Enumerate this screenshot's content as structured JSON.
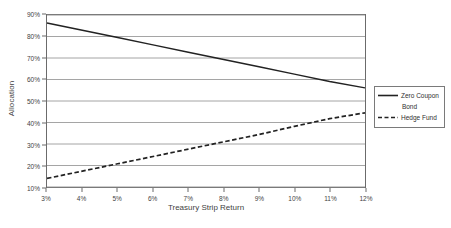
{
  "chart_data": {
    "type": "line",
    "title": "",
    "xlabel": "Treasury Strip Return",
    "ylabel": "Allocation",
    "x": [
      3,
      4,
      5,
      6,
      7,
      8,
      9,
      10,
      11,
      12
    ],
    "x_tick_labels": [
      "3%",
      "4%",
      "5%",
      "6%",
      "7%",
      "8%",
      "9%",
      "10%",
      "11%",
      "12%"
    ],
    "y_tick_labels": [
      "10%",
      "20%",
      "30%",
      "40%",
      "50%",
      "60%",
      "70%",
      "80%",
      "90%"
    ],
    "y_ticks": [
      10,
      20,
      30,
      40,
      50,
      60,
      70,
      80,
      90
    ],
    "xlim": [
      3,
      12
    ],
    "ylim": [
      10,
      90
    ],
    "grid": "horizontal",
    "legend_position": "right-outside",
    "series": [
      {
        "name": "Zero Coupon Bond",
        "style": "solid",
        "color": "#222222",
        "values": [
          86.3,
          82.9,
          79.5,
          76.1,
          72.7,
          69.3,
          65.9,
          62.5,
          59.1,
          56.1
        ]
      },
      {
        "name": "Hedge Fund",
        "style": "dashed",
        "color": "#222222",
        "values": [
          14.0,
          17.4,
          20.8,
          24.2,
          27.6,
          31.0,
          34.4,
          38.2,
          41.8,
          44.5
        ]
      }
    ]
  },
  "legend": {
    "entries": [
      {
        "label": "Zero Coupon",
        "continuation": "Bond",
        "style": "solid"
      },
      {
        "label": "Hedge Fund",
        "continuation": "",
        "style": "dashed"
      }
    ]
  },
  "colors": {
    "axis": "#6b6b6b",
    "gridline": "#8e8e8e",
    "series": "#222222",
    "text": "#3f3f3f",
    "background": "#ffffff"
  }
}
